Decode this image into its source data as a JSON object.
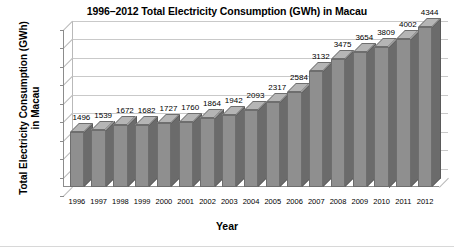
{
  "chart_data": {
    "type": "bar",
    "title": "1996–2012 Total Electricity Consumption (GWh) in Macau",
    "xlabel": "Year",
    "ylabel_line1": "Total Electricity Consumption (GWh)",
    "ylabel_line2": "in Macau",
    "categories": [
      "1996",
      "1997",
      "1998",
      "1999",
      "2000",
      "2001",
      "2002",
      "2003",
      "2004",
      "2005",
      "2006",
      "2007",
      "2008",
      "2009",
      "2010",
      "2011",
      "2012"
    ],
    "values": [
      1496,
      1539,
      1672,
      1682,
      1727,
      1760,
      1864,
      1942,
      2093,
      2317,
      2584,
      3132,
      3475,
      3654,
      3809,
      4002,
      4344
    ],
    "ylim": [
      0,
      4500
    ],
    "ytick_labels": [
      "0",
      "500",
      "1000",
      "1500",
      "2000",
      "2500",
      "3000",
      "3500",
      "4000",
      "4500"
    ],
    "ytick_values": [
      0,
      500,
      1000,
      1500,
      2000,
      2500,
      3000,
      3500,
      4000,
      4500
    ],
    "grid": true,
    "legend": "none",
    "bar_color": "#8f8f8f",
    "bar_side_color": "#6b6b6b",
    "bar_top_color": "#b5b5b5",
    "grid_color": "#c9c9c9",
    "axis_color": "#8c8c8c"
  }
}
